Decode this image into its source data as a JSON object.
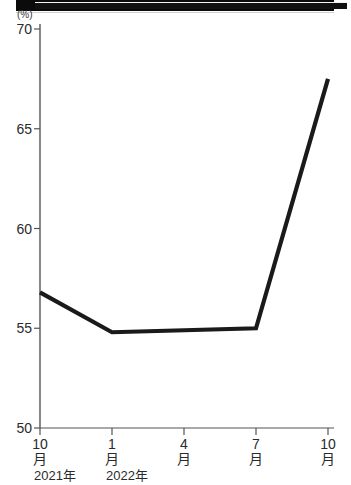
{
  "chart_data": {
    "type": "line",
    "title": "",
    "xlabel": "",
    "ylabel": "(%)",
    "unit": "(%)",
    "ylim": [
      50,
      70
    ],
    "yticks": [
      50,
      55,
      60,
      65,
      70
    ],
    "ytick_labels": [
      "50",
      "55",
      "60",
      "65",
      "70"
    ],
    "grid": false,
    "legend": null,
    "x_categories": [
      "10月",
      "1月",
      "4月",
      "7月",
      "10月"
    ],
    "x_tick_numbers": [
      "10",
      "1",
      "4",
      "7",
      "10"
    ],
    "x_tick_units": [
      "月",
      "月",
      "月",
      "月",
      "月"
    ],
    "x_year_labels": [
      {
        "text": "2021年",
        "at_category_index": 0
      },
      {
        "text": "2022年",
        "at_category_index": 1
      }
    ],
    "series": [
      {
        "name": "",
        "color": "#1a1a1a",
        "points": [
          {
            "x": "2021年10月",
            "y": 56.8
          },
          {
            "x": "2022年1月",
            "y": 54.8
          },
          {
            "x": "2022年7月",
            "y": 55.0
          },
          {
            "x": "2022年10月",
            "y": 67.5
          }
        ],
        "values": [
          56.8,
          54.8,
          55.0,
          67.5
        ]
      }
    ]
  },
  "axes": {
    "y_unit_caption": "(%)"
  },
  "banner": {
    "label": "title-band"
  }
}
